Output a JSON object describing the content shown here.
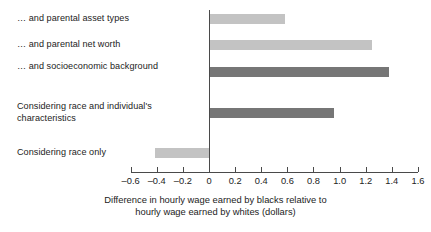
{
  "chart_data": {
    "type": "bar",
    "orientation": "horizontal",
    "title": "",
    "subtitle": "",
    "xlabel_line1": "Difference in hourly wage earned by blacks relative to",
    "xlabel_line2": "hourly wage earned by whites (dollars)",
    "ylabel": "",
    "xlim": [
      -0.6,
      1.6
    ],
    "xticks": [
      -0.6,
      -0.4,
      -0.2,
      0,
      0.2,
      0.4,
      0.6,
      0.8,
      1.0,
      1.2,
      1.4,
      1.6
    ],
    "xtick_labels": [
      "–0.6",
      "–0.4",
      "–0.2",
      "0",
      "0.2",
      "0.4",
      "0.6",
      "0.8",
      "1.0",
      "1.2",
      "1.4",
      "1.6"
    ],
    "grid": false,
    "legend": "none",
    "zero_reference_line": true,
    "categories": [
      "… and parental asset types",
      "… and parental net worth",
      "… and socioeconomic background",
      "Considering race and individual's characteristics",
      "Considering race only"
    ],
    "values": [
      0.58,
      1.25,
      1.38,
      0.96,
      -0.41
    ],
    "bar_colors": [
      "#c3c3c3",
      "#c3c3c3",
      "#767676",
      "#767676",
      "#c3c3c3"
    ],
    "colors": {
      "light_bar": "#c3c3c3",
      "dark_bar": "#767676",
      "axis": "#4a4a4a",
      "text": "#232323",
      "background": "#ffffff"
    }
  }
}
